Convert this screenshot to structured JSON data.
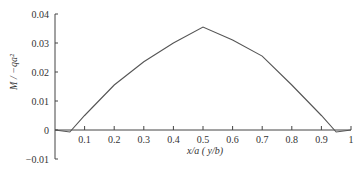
{
  "chart_data": {
    "type": "line",
    "title": "",
    "xlabel": "x/a  ( y/b)",
    "ylabel": "M / −qa²",
    "xlim": [
      0,
      1
    ],
    "ylim": [
      -0.01,
      0.04
    ],
    "grid": false,
    "legend": null,
    "x_ticks": [
      "0.1",
      "0.2",
      "0.3",
      "0.4",
      "0.5",
      "0.6",
      "0.7",
      "0.8",
      "0.9",
      "1"
    ],
    "y_ticks": [
      "0.04",
      "0.03",
      "0.02",
      "0.01",
      "0",
      "−0.01"
    ],
    "series": [
      {
        "name": "M",
        "x": [
          0,
          0.05,
          0.1,
          0.2,
          0.3,
          0.4,
          0.5,
          0.6,
          0.7,
          0.8,
          0.9,
          0.95,
          1.0
        ],
        "values": [
          0,
          -0.0007,
          0.005,
          0.0155,
          0.0235,
          0.03,
          0.0355,
          0.031,
          0.0255,
          0.0155,
          0.005,
          -0.0007,
          0
        ]
      }
    ],
    "line_color": "#555555"
  }
}
